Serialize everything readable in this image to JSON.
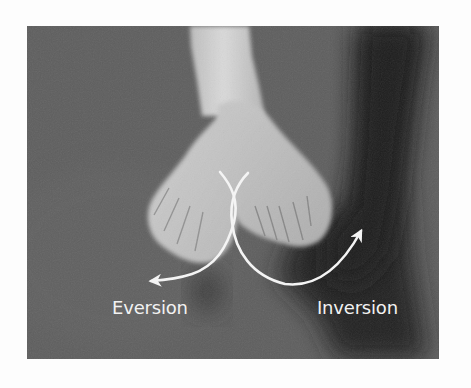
{
  "figure": {
    "labels": {
      "left": "Eversion",
      "right": "Inversion"
    },
    "arrows": [
      {
        "name": "eversion-arrow",
        "direction": "left-down"
      },
      {
        "name": "inversion-arrow",
        "direction": "right-up"
      }
    ],
    "colors": {
      "page_background": "#fdfdfd",
      "photo_background": "#5f5f5f",
      "shadow": "#262626",
      "skin": "#c4c4c4",
      "skin_highlight": "#d8d8d8",
      "arrow": "#f4f4f4",
      "label_text": "#f2f2f2"
    }
  }
}
